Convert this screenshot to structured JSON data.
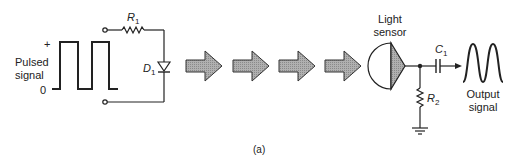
{
  "figure": {
    "caption": "(a)",
    "input": {
      "label_line1": "Pulsed",
      "label_line2": "signal",
      "plus_marker": "+",
      "zero_marker": "0"
    },
    "components": {
      "r1": {
        "letter": "R",
        "sub": "1"
      },
      "d1": {
        "letter": "D",
        "sub": "1"
      },
      "c1": {
        "letter": "C",
        "sub": "1"
      },
      "r2": {
        "letter": "R",
        "sub": "2"
      }
    },
    "sensor": {
      "label_line1": "Light",
      "label_line2": "sensor"
    },
    "output": {
      "label_line1": "Output",
      "label_line2": "signal"
    },
    "light_arrows_count": 4,
    "colors": {
      "line": "#222222",
      "arrow_fill": "#a8a8a8",
      "sensor_fill": "#9a9a9a"
    }
  }
}
